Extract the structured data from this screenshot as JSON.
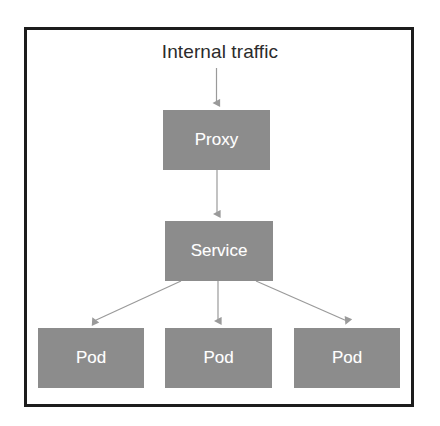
{
  "figure": {
    "title": "Internal traffic",
    "frame_color": "#1c1c1c",
    "background_color": "#ffffff"
  },
  "theme": {
    "node_fill": "#8c8c8c",
    "node_text_color": "#ffffff",
    "connector_color": "#9a9a9a",
    "title_color": "#2b2b2b"
  },
  "nodes": [
    {
      "id": "proxy",
      "label": "Proxy",
      "tier": "proxy"
    },
    {
      "id": "service",
      "label": "Service",
      "tier": "service"
    },
    {
      "id": "pod-1",
      "label": "Pod",
      "tier": "pod"
    },
    {
      "id": "pod-2",
      "label": "Pod",
      "tier": "pod"
    },
    {
      "id": "pod-3",
      "label": "Pod",
      "tier": "pod"
    }
  ],
  "connectors": [
    {
      "id": "traffic-to-proxy",
      "from": "Internal traffic",
      "to": "Proxy",
      "style": "arrow"
    },
    {
      "id": "proxy-to-service",
      "from": "Proxy",
      "to": "Service",
      "style": "arrow"
    },
    {
      "id": "service-to-pod-1",
      "from": "Service",
      "to": "Pod",
      "style": "arrow"
    },
    {
      "id": "service-to-pod-2",
      "from": "Service",
      "to": "Pod",
      "style": "arrow"
    },
    {
      "id": "service-to-pod-3",
      "from": "Service",
      "to": "Pod",
      "style": "arrow"
    }
  ]
}
